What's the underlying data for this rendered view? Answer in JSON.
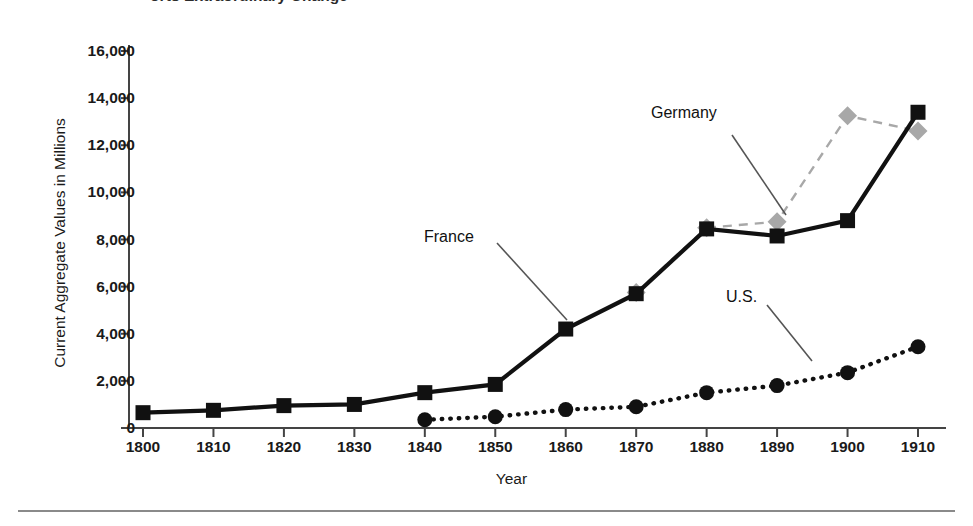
{
  "title": "orts Extraordinary Change",
  "chart_data": {
    "type": "line",
    "title": "orts Extraordinary Change",
    "xlabel": "Year",
    "ylabel": "Current Aggregate Values in Millions",
    "x": [
      1800,
      1810,
      1820,
      1830,
      1840,
      1850,
      1860,
      1870,
      1880,
      1890,
      1900,
      1910
    ],
    "xticklabels": [
      "1800",
      "1810",
      "1820",
      "1830",
      "1840",
      "1850",
      "1860",
      "1870",
      "1880",
      "1890",
      "1900",
      "1910"
    ],
    "yticklabels": [
      "0",
      "2,000",
      "4,000",
      "6,000",
      "8,000",
      "10,000",
      "12,000",
      "14,000",
      "16,000"
    ],
    "yticks": [
      0,
      2000,
      4000,
      6000,
      8000,
      10000,
      12000,
      14000,
      16000
    ],
    "xlim": [
      1795,
      1915
    ],
    "ylim": [
      0,
      16000
    ],
    "grid": false,
    "legend": "inline-annotations",
    "series": [
      {
        "name": "France",
        "style": "solid",
        "color": "#111111",
        "marker": "square",
        "x": [
          1800,
          1810,
          1820,
          1830,
          1840,
          1850,
          1860,
          1870,
          1880,
          1890,
          1900,
          1910
        ],
        "values": [
          650,
          750,
          950,
          1000,
          1500,
          1850,
          4200,
          5700,
          8450,
          8150,
          8800,
          13400
        ]
      },
      {
        "name": "Germany",
        "style": "dashed",
        "color": "#a8a8a8",
        "marker": "diamond",
        "x": [
          1870,
          1880,
          1890,
          1900,
          1910
        ],
        "values": [
          5750,
          8500,
          8750,
          13250,
          12600
        ]
      },
      {
        "name": "U.S.",
        "style": "dotted",
        "color": "#111111",
        "marker": "circle",
        "x": [
          1840,
          1850,
          1860,
          1870,
          1880,
          1890,
          1900,
          1910
        ],
        "values": [
          350,
          480,
          780,
          900,
          1500,
          1800,
          2350,
          3450
        ]
      }
    ],
    "annotations": [
      {
        "label": "France",
        "x": 424,
        "y": 228
      },
      {
        "label": "Germany",
        "x": 651,
        "y": 104
      },
      {
        "label": "U.S.",
        "x": 726,
        "y": 288
      }
    ]
  }
}
